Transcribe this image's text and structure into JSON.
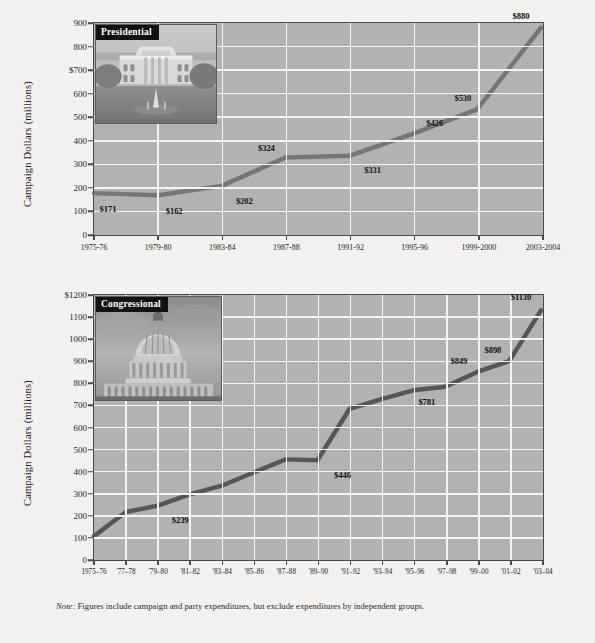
{
  "note": {
    "label": "Note:",
    "text": " Figures include campaign and party expenditures, but exclude expenditures by independent groups."
  },
  "colors": {
    "plot_background": "#b2b2b2",
    "gridline": "#f4f4f4",
    "axis": "#4a4a4a",
    "presidential_line": "#767676",
    "congressional_line": "#565656",
    "caption_background": "#121212",
    "caption_text": "#ffffff",
    "page_background": "#f2f1ef"
  },
  "chart_data": [
    {
      "type": "line",
      "id": "presidential",
      "title": "Presidential",
      "caption": "Presidential",
      "photo_alt": "white-house-photo",
      "ylabel": "Campaign Dollars (millions)",
      "xlabel": "",
      "ylim": [
        0,
        900
      ],
      "yticks": [
        0,
        100,
        200,
        300,
        400,
        500,
        600,
        700,
        800,
        900
      ],
      "ytick_labels": [
        "0",
        "100",
        "200",
        "300",
        "400",
        "500",
        "600",
        "$700",
        "800",
        "900"
      ],
      "grid": true,
      "legend": "none",
      "categories": [
        "1975-76",
        "1979-80",
        "1983-84",
        "1987-88",
        "1991-92",
        "1995-96",
        "1999-2000",
        "2003-2004"
      ],
      "values": [
        171,
        162,
        202,
        324,
        331,
        426,
        530,
        880
      ],
      "point_labels": [
        "$171",
        "$162",
        "$202",
        "$324",
        "$331",
        "$426",
        "$530",
        "$880"
      ]
    },
    {
      "type": "line",
      "id": "congressional",
      "title": "Congressional",
      "caption": "Congressional",
      "photo_alt": "us-capitol-photo",
      "ylabel": "Campaign Dollars (millions)",
      "xlabel": "",
      "ylim": [
        0,
        1200
      ],
      "yticks": [
        0,
        100,
        200,
        300,
        400,
        500,
        600,
        700,
        800,
        900,
        1000,
        1100,
        1200
      ],
      "ytick_labels": [
        "0",
        "100",
        "200",
        "300",
        "400",
        "500",
        "600",
        "700",
        "800",
        "900",
        "1000",
        "1100",
        "$1200"
      ],
      "grid": true,
      "legend": "none",
      "categories": [
        "1975–76",
        "'77–78",
        "'79–80",
        "'81–82",
        "'83–84",
        "'85–86",
        "'87–88",
        "'89–90",
        "'91–92",
        "'93–94",
        "'95–96",
        "'97–98",
        "'99–00",
        "'01–02",
        "'03–04"
      ],
      "values": [
        100,
        210,
        239,
        290,
        330,
        390,
        450,
        446,
        680,
        725,
        765,
        781,
        849,
        898,
        1130
      ],
      "point_labels": [
        "",
        "",
        "$239",
        "",
        "",
        "",
        "",
        "$446",
        "",
        "",
        "",
        "$781",
        "$849",
        "$898",
        "$1130"
      ]
    }
  ]
}
